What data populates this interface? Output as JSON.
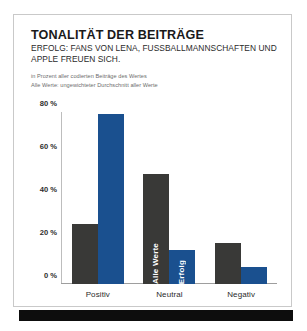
{
  "card": {
    "title": "TONALITÄT DER BEITRÄGE",
    "subtitle_line1": "ERFOLG: FANS VON LENA, FUSSBALLMANNSCHAFTEN UND",
    "subtitle_line2": "APPLE FREUEN SICH.",
    "note_line1": "in Prozent aller codierten Beiträge des Wertes",
    "note_line2": "Alle Werte: ungewichteter Durchschnitt aller Werte"
  },
  "colors": {
    "series_alle_werte": "#393937",
    "series_erfolg": "#1a508f",
    "axis": "#9e9e9e",
    "footer": "#0d0d0d",
    "card_border": "#c9c9c9"
  },
  "chart_data": {
    "type": "bar",
    "title": "TONALITÄT DER BEITRÄGE",
    "subtitle": "ERFOLG: FANS VON LENA, FUSSBALLMANNSCHAFTEN UND APPLE FREUEN SICH.",
    "xlabel": "",
    "ylabel": "",
    "ylim": [
      0,
      80
    ],
    "grid": false,
    "legend": "in-bar labels",
    "categories": [
      "Positiv",
      "Neutral",
      "Negativ"
    ],
    "yticks": [
      0,
      20,
      40,
      60,
      80
    ],
    "ytick_labels": [
      "0 %",
      "20 %",
      "40 %",
      "60 %",
      "80 %"
    ],
    "series": [
      {
        "name": "Alle Werte",
        "color": "#393937",
        "values": [
          28,
          51,
          19
        ]
      },
      {
        "name": "Erfolg",
        "color": "#1a508f",
        "values": [
          79,
          16,
          8
        ]
      }
    ]
  }
}
